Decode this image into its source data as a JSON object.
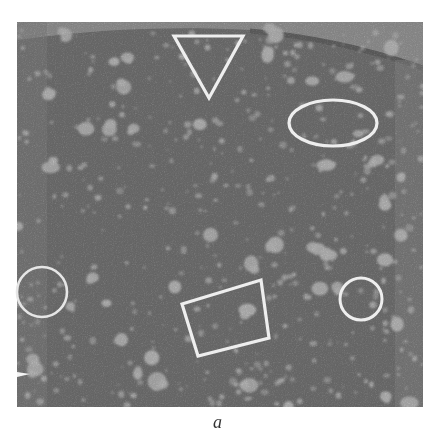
{
  "figure": {
    "panel_label": "a",
    "image": {
      "x": 17,
      "y": 22,
      "width": 406,
      "height": 385,
      "background_color": "#4a4a4a",
      "particle_color": "#d6d6d6",
      "membrane_region_color": "#a8a8a8"
    },
    "annotations": [
      {
        "shape": "triangle",
        "points": [
          [
            174,
            36
          ],
          [
            243,
            36
          ],
          [
            209,
            98
          ]
        ],
        "color": "#eeeeee"
      },
      {
        "shape": "ellipse",
        "cx": 333,
        "cy": 123,
        "rx": 44,
        "ry": 23,
        "color": "#eeeeee"
      },
      {
        "shape": "circle",
        "cx": 42,
        "cy": 292,
        "r": 25,
        "color": "#e6e6e6"
      },
      {
        "shape": "circle",
        "cx": 361,
        "cy": 299,
        "r": 21,
        "color": "#eeeeee"
      },
      {
        "shape": "rotated-rectangle",
        "points": [
          [
            182,
            304
          ],
          [
            261,
            280
          ],
          [
            269,
            338
          ],
          [
            198,
            356
          ]
        ],
        "color": "#eeeeee"
      }
    ]
  }
}
